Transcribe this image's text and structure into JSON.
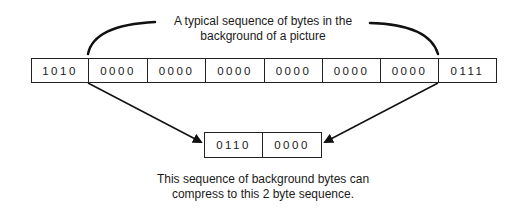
{
  "diagram": {
    "top_label": {
      "line1": "A typical sequence of bytes in the",
      "line2": "background of a picture"
    },
    "original_sequence": {
      "cells": [
        "1010",
        "0000",
        "0000",
        "0000",
        "0000",
        "0000",
        "0000",
        "0111"
      ]
    },
    "compressed_sequence": {
      "cells": [
        "0110",
        "0000"
      ]
    },
    "bottom_label": {
      "line1": "This sequence of background bytes can",
      "line2": "compress to this 2 byte sequence."
    },
    "colors": {
      "stroke": "#222222",
      "background": "#ffffff",
      "text": "#1a1a1a"
    }
  }
}
